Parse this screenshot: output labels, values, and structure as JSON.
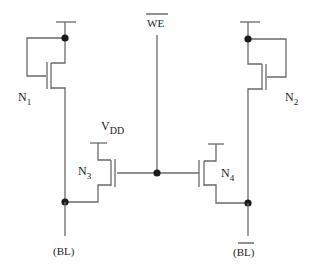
{
  "diagram": {
    "type": "circuit-schematic",
    "title": "",
    "labels": {
      "n1": "N",
      "n1_sub": "1",
      "n2": "N",
      "n2_sub": "2",
      "n3": "N",
      "n3_sub": "3",
      "n4": "N",
      "n4_sub": "4",
      "vdd": "V",
      "vdd_sub": "DD",
      "we": "WE",
      "bl_left": "(BL)",
      "bl_right": "(BL)"
    },
    "components": [
      {
        "id": "N1",
        "kind": "nmos",
        "connection": "diode-connected load to left bit line"
      },
      {
        "id": "N2",
        "kind": "nmos",
        "connection": "diode-connected load to right bit line"
      },
      {
        "id": "N3",
        "kind": "nmos",
        "connection": "VDD to BL, gate = WE-bar"
      },
      {
        "id": "N4",
        "kind": "nmos",
        "connection": "VDD to BL-bar, gate = WE-bar"
      }
    ],
    "nets": [
      "VDD",
      "WE-bar",
      "BL",
      "BL-bar"
    ],
    "colors": {
      "wire": "#6a6a6a",
      "node": "#1a1a1a",
      "text": "#222222",
      "background": "#ffffff"
    }
  }
}
